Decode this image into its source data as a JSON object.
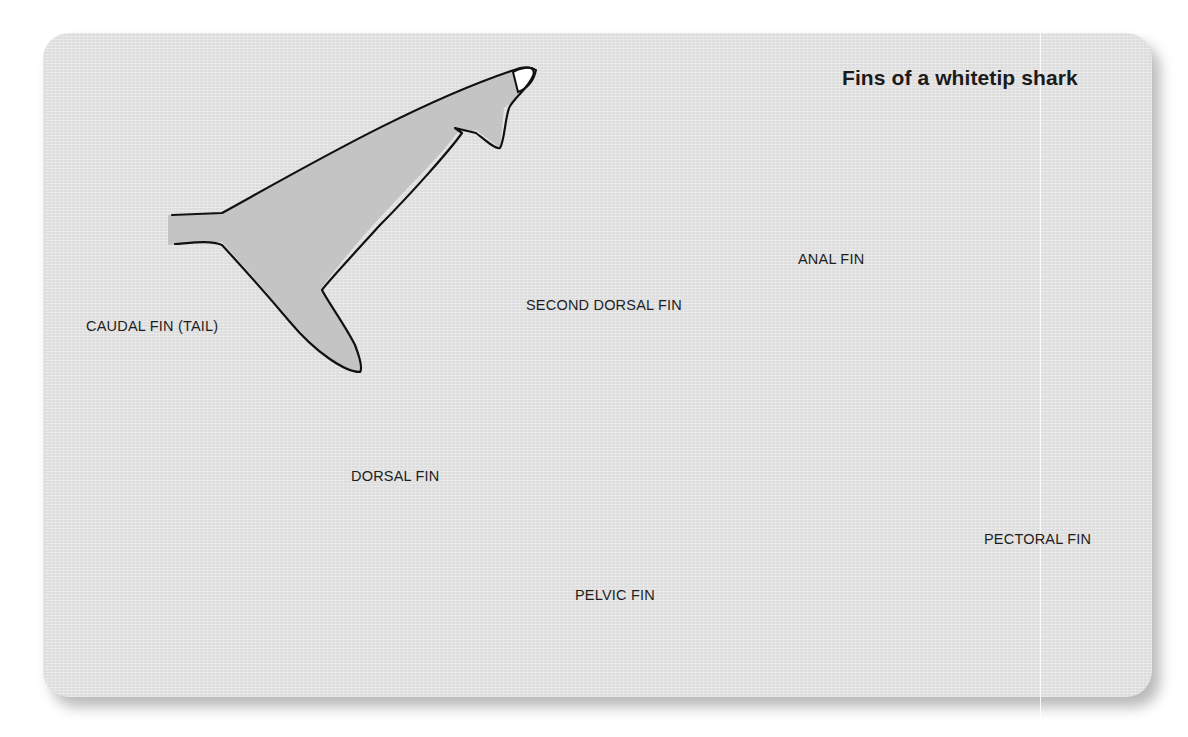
{
  "diagram": {
    "title": "Fins of a whitetip shark",
    "subject": "whitetip shark",
    "colors": {
      "panel_background": "#e6e6e6",
      "fin_fill": "#c4c4c4",
      "outline": "#111111",
      "fin_tip": "#ffffff",
      "text": "#1e1e1e"
    },
    "fins": [
      {
        "id": "caudal",
        "label": "CAUDAL FIN (TAIL)",
        "has_white_tip": true
      },
      {
        "id": "second-dorsal",
        "label": "SECOND DORSAL FIN",
        "has_white_tip": true
      },
      {
        "id": "anal",
        "label": "ANAL FIN",
        "has_white_tip": false
      },
      {
        "id": "dorsal",
        "label": "DORSAL FIN",
        "has_white_tip": true
      },
      {
        "id": "pelvic",
        "label": "PELVIC FIN",
        "has_white_tip": false
      },
      {
        "id": "pectoral",
        "label": "PECTORAL FIN",
        "has_white_tip": false
      }
    ]
  }
}
